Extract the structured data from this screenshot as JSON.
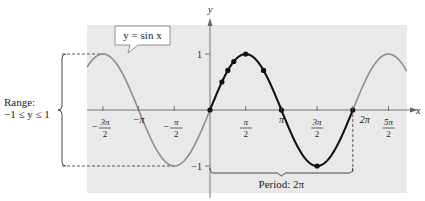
{
  "chart_data": {
    "type": "line",
    "title": "",
    "function_label": "y = sin x",
    "xlabel": "x",
    "ylabel": "y",
    "xlim": [
      -5.41,
      8.65
    ],
    "ylim": [
      -1,
      1
    ],
    "x_ticks": [
      {
        "value": -4.712,
        "num": "3π",
        "den": "2",
        "neg": true
      },
      {
        "value": -3.1416,
        "text": "−π"
      },
      {
        "value": -1.5708,
        "num": "π",
        "den": "2",
        "neg": true
      },
      {
        "value": 1.5708,
        "num": "π",
        "den": "2",
        "neg": false
      },
      {
        "value": 3.1416,
        "text": "π"
      },
      {
        "value": 4.712,
        "num": "3π",
        "den": "2",
        "neg": false
      },
      {
        "value": 6.2832,
        "text": "2π"
      },
      {
        "value": 7.854,
        "num": "5π",
        "den": "2",
        "neg": false
      }
    ],
    "y_ticks": [
      {
        "value": 1,
        "text": "1"
      },
      {
        "value": -1,
        "text": "−1"
      }
    ],
    "series": [
      {
        "name": "sin x (full)",
        "color": "#8c8c8c",
        "x_range": [
          -5.41,
          8.65
        ]
      },
      {
        "name": "sin x (one period)",
        "color": "#111111",
        "x_range": [
          0,
          6.2832
        ]
      }
    ],
    "key_points": [
      {
        "x": 0,
        "y": 0
      },
      {
        "x": 0.5236,
        "y": 0.5
      },
      {
        "x": 0.7854,
        "y": 0.7071
      },
      {
        "x": 1.0472,
        "y": 0.866
      },
      {
        "x": 1.5708,
        "y": 1
      },
      {
        "x": 2.3562,
        "y": 0.7071
      },
      {
        "x": 3.1416,
        "y": 0
      },
      {
        "x": 4.7124,
        "y": -1
      },
      {
        "x": 6.2832,
        "y": 0
      }
    ],
    "annotations": {
      "range_title": "Range:",
      "range_value": "−1 ≤ y ≤ 1",
      "period": "Period: 2π"
    },
    "grid": false,
    "background": "#e8e8e8"
  }
}
